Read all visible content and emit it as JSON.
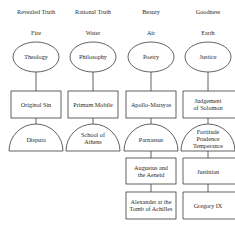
{
  "columns": [
    {
      "header": "Revealed Truth",
      "element": "Fire",
      "ellipse": "Theology",
      "box1": "Original Sin",
      "dome": [
        "Disputa"
      ],
      "box2": null,
      "box3": null
    },
    {
      "header": "Rational Truth",
      "element": "Water",
      "ellipse": "Philosophy",
      "box1": "Primum Mobile",
      "dome": [
        "School of",
        "Athens"
      ],
      "box2": null,
      "box3": null
    },
    {
      "header": "Beauty",
      "element": "Air",
      "ellipse": "Poetry",
      "box1": "Apollo-Marsyas",
      "dome": [
        "Parnassus"
      ],
      "box2": [
        "Augustus and",
        "the Aeneid"
      ],
      "box3": [
        "Alexander at the",
        "Tomb of Achilles"
      ]
    },
    {
      "header": "Goodness",
      "element": "Earth",
      "ellipse": "Justice",
      "box1": [
        "Judgement",
        "of Solomon"
      ],
      "dome": [
        "Fortitude",
        "Prudence",
        "Temperance"
      ],
      "box2": [
        "Justinian"
      ],
      "box3": [
        "Gregory IX"
      ]
    }
  ],
  "colors": {
    "line": "#3a3a3a",
    "text": "#2a2a2a",
    "background": "#ffffff"
  }
}
